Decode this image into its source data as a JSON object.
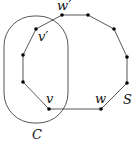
{
  "diagram": {
    "region": {
      "label": "C",
      "x": 4,
      "y": 16,
      "width": 64,
      "height": 107,
      "rx": 30
    },
    "polygon": {
      "label": "S",
      "vertices": [
        {
          "x": 62,
          "y": 15,
          "label": "w′"
        },
        {
          "x": 88,
          "y": 15,
          "label": ""
        },
        {
          "x": 114,
          "y": 29,
          "label": ""
        },
        {
          "x": 127,
          "y": 57,
          "label": ""
        },
        {
          "x": 127,
          "y": 83,
          "label": ""
        },
        {
          "x": 101,
          "y": 109,
          "label": "w"
        },
        {
          "x": 49,
          "y": 109,
          "label": "v"
        },
        {
          "x": 23,
          "y": 82,
          "label": ""
        },
        {
          "x": 23,
          "y": 55,
          "label": ""
        },
        {
          "x": 36,
          "y": 29,
          "label": "v′"
        }
      ]
    },
    "labels": {
      "w_prime": "w′",
      "v_prime": "v′",
      "v": "v",
      "w": "w",
      "S": "S",
      "C": "C"
    },
    "colors": {
      "stroke": "#444444",
      "vertex": "#000000",
      "text": "#111111"
    }
  }
}
